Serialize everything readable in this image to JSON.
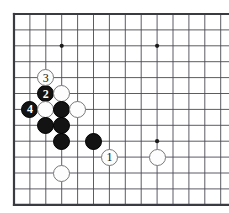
{
  "figure": {
    "name": "go-board-diagram",
    "type": "go-board-corner",
    "background_color": "#ffffff"
  },
  "board": {
    "origin_x": 14,
    "origin_y": 14,
    "spacing": 15.9,
    "cols": 14,
    "rows": 12,
    "line_color": "#4a4a52",
    "border_color": "#3a3a42",
    "border_width": 2.2,
    "line_width": 0.9,
    "star_point_color": "#1b1b1b",
    "star_point_radius": 2.1,
    "star_points": [
      {
        "col": 3,
        "row": 2
      },
      {
        "col": 9,
        "row": 2
      },
      {
        "col": 9,
        "row": 8
      }
    ]
  },
  "stones": [
    {
      "id": "w-move-1",
      "color": "white",
      "col": 6,
      "row": 9,
      "label": "1"
    },
    {
      "id": "b-move-2",
      "color": "black",
      "col": 2,
      "row": 5,
      "label": "2"
    },
    {
      "id": "w-move-3",
      "color": "white",
      "col": 2,
      "row": 4,
      "label": "3"
    },
    {
      "id": "b-move-4",
      "color": "black",
      "col": 1,
      "row": 6,
      "label": "4"
    },
    {
      "id": "w-c3-r5",
      "color": "white",
      "col": 3,
      "row": 5,
      "label": ""
    },
    {
      "id": "w-c2-r6",
      "color": "white",
      "col": 2,
      "row": 6,
      "label": ""
    },
    {
      "id": "b-c3-r6",
      "color": "black",
      "col": 3,
      "row": 6,
      "label": ""
    },
    {
      "id": "w-c4-r6",
      "color": "white",
      "col": 4,
      "row": 6,
      "label": ""
    },
    {
      "id": "b-c2-r7",
      "color": "black",
      "col": 2,
      "row": 7,
      "label": ""
    },
    {
      "id": "b-c3-r7",
      "color": "black",
      "col": 3,
      "row": 7,
      "label": ""
    },
    {
      "id": "b-c3-r8",
      "color": "black",
      "col": 3,
      "row": 8,
      "label": ""
    },
    {
      "id": "b-c5-r8",
      "color": "black",
      "col": 5,
      "row": 8,
      "label": ""
    },
    {
      "id": "w-c9-r9",
      "color": "white",
      "col": 9,
      "row": 9,
      "label": ""
    },
    {
      "id": "w-c3-r10",
      "color": "white",
      "col": 3,
      "row": 10,
      "label": ""
    }
  ],
  "stone_style": {
    "diameter": 17,
    "black_fill": "#131313",
    "white_fill": "#fdfdfd",
    "white_stroke": "#7a7a7a",
    "black_label_color": "#ffffff",
    "white_label_color": "#111111"
  }
}
